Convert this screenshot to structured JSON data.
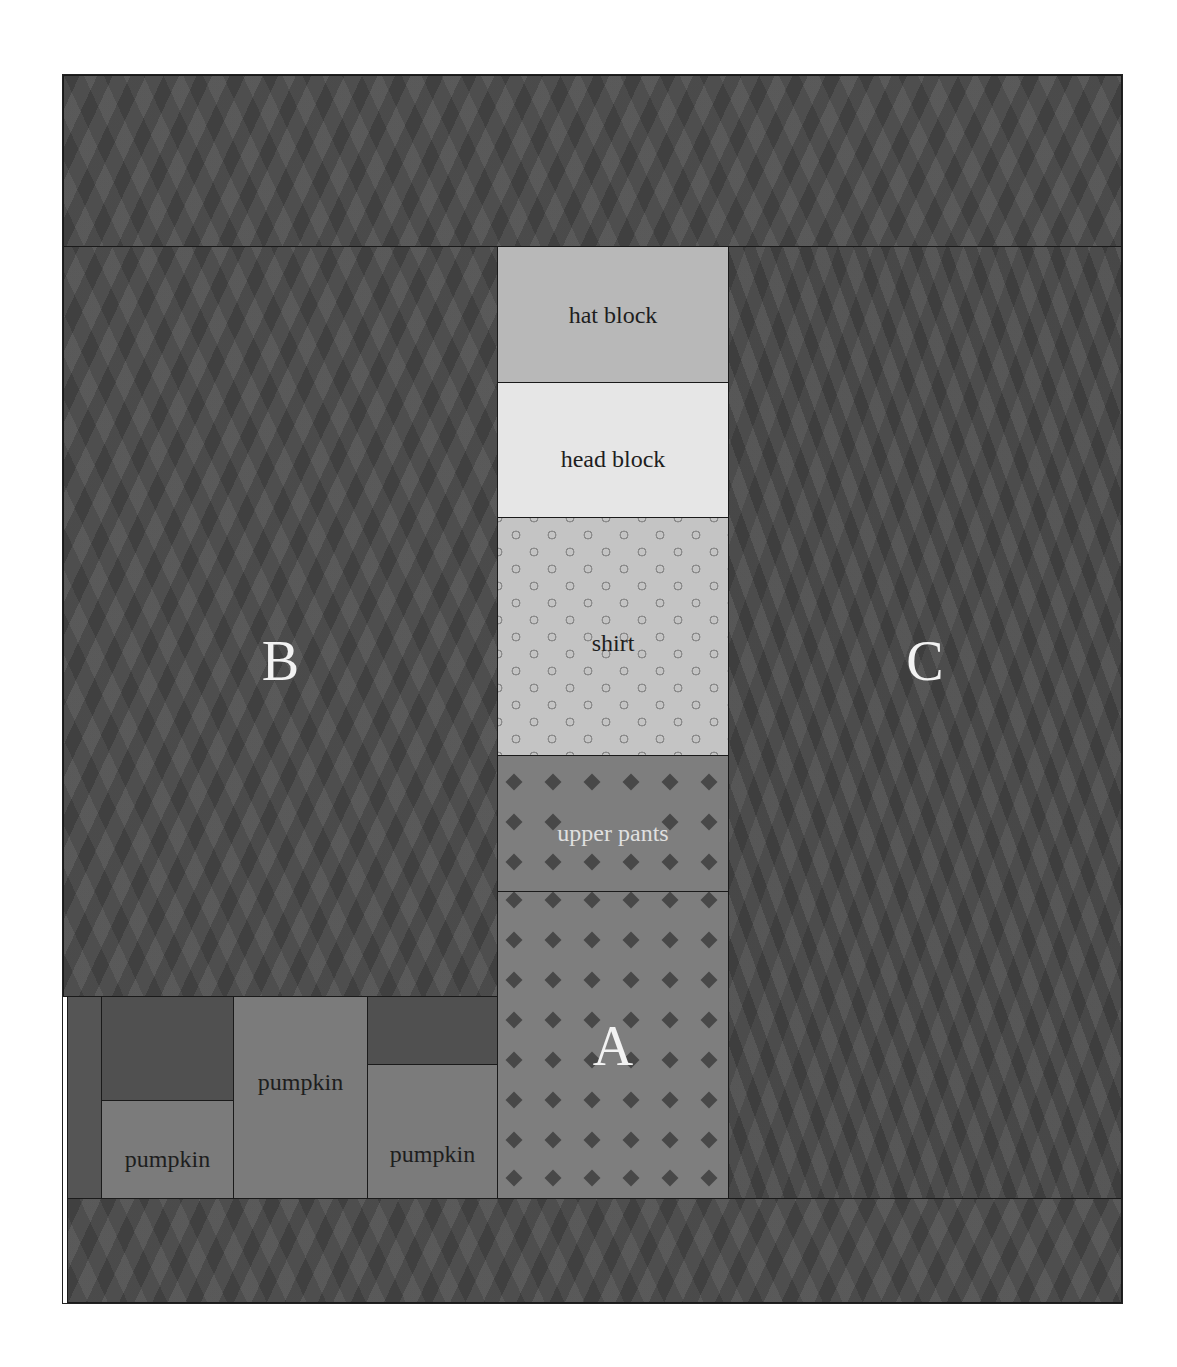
{
  "diagram": {
    "type": "quilt-block-layout",
    "colors": {
      "border_fabric": "#4d4d4d",
      "hat_block": "#b8b8b8",
      "head_block": "#e6e6e6",
      "shirt": "#c4c4c4",
      "pants": "#7e7e7e",
      "pumpkin": "#7b7b7b",
      "seam": "#1a1a1a"
    },
    "regions": {
      "top_border": {
        "label": ""
      },
      "bottom_border": {
        "label": ""
      },
      "B": {
        "label": "B"
      },
      "C": {
        "label": "C"
      },
      "A": {
        "label": "A"
      }
    },
    "center_column": [
      {
        "id": "hat",
        "label": "hat block"
      },
      {
        "id": "head",
        "label": "head block"
      },
      {
        "id": "shirt",
        "label": "shirt"
      },
      {
        "id": "upper_pants",
        "label": "upper pants"
      },
      {
        "id": "lower_pants",
        "label": "A"
      }
    ],
    "pumpkins": [
      {
        "label": "pumpkin"
      },
      {
        "label": "pumpkin"
      },
      {
        "label": "pumpkin"
      }
    ]
  }
}
